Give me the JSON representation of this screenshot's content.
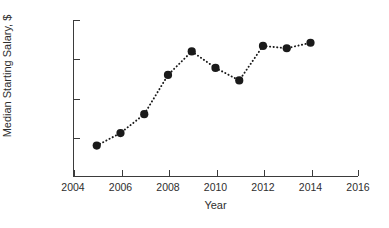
{
  "chart_data": {
    "type": "line",
    "title": "",
    "xlabel": "Year",
    "ylabel": "Median Starting Salary, $",
    "x": [
      2005,
      2006,
      2007,
      2008,
      2009,
      2010,
      2011,
      2012,
      2013,
      2014
    ],
    "values": [
      54000,
      55600,
      58000,
      63000,
      66000,
      63900,
      62300,
      66700,
      66400,
      67100
    ],
    "series": [
      {
        "name": "Median Starting Salary",
        "values": [
          54000,
          55600,
          58000,
          63000,
          66000,
          63900,
          62300,
          66700,
          66400,
          67100
        ]
      }
    ],
    "xlim": [
      2004,
      2016
    ],
    "ylim": [
      50000,
      70000
    ],
    "xticks": [
      2004,
      2006,
      2008,
      2010,
      2012,
      2014,
      2016
    ],
    "yticks": [
      50000,
      55000,
      60000,
      65000,
      70000
    ],
    "xtick_labels": [
      "2004",
      "2006",
      "2008",
      "2010",
      "2012",
      "2014",
      "2016"
    ],
    "ytick_labels": [
      "50000",
      "55000",
      "60000",
      "65000",
      "70000"
    ],
    "grid": false,
    "legend": null,
    "marker": "filled-circle",
    "line_style": "dotted",
    "marker_color": "#1a1a1a",
    "line_color": "#1a1a1a",
    "axis_color": "#3b3b3b",
    "background_color": "#ffffff"
  }
}
